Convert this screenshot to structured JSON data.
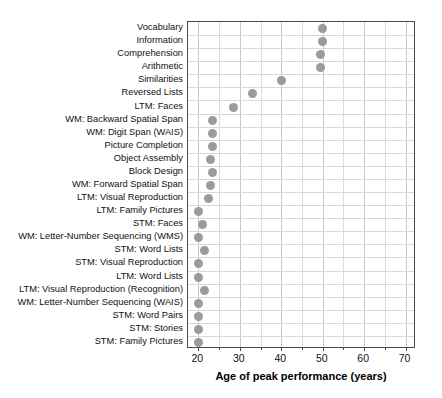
{
  "chart_data": {
    "type": "scatter",
    "title": "",
    "xlabel": "Age of peak performance (years)",
    "ylabel": "",
    "xlim": [
      17.5,
      72.5
    ],
    "xticks": [
      20,
      30,
      40,
      50,
      60,
      70
    ],
    "xtick_labels": [
      "20",
      "30",
      "40",
      "50",
      "60",
      "70"
    ],
    "grid": true,
    "legend": "none",
    "marker_color": "#9b9b9b",
    "axis_color": "#4a4a4a",
    "gridline_color": "#d0d0d0",
    "categories": [
      "Vocabulary",
      "Information",
      "Comprehension",
      "Arithmetic",
      "Similarities",
      "Reversed Lists",
      "LTM: Faces",
      "WM: Backward Spatial Span",
      "WM: Digit Span (WAIS)",
      "Picture Completion",
      "Object Assembly",
      "Block Design",
      "WM: Forward Spatial Span",
      "LTM: Visual Reproduction",
      "LTM: Family Pictures",
      "STM: Faces",
      "WM: Letter-Number Sequencing (WMS)",
      "STM: Word Lists",
      "STM: Visual Reproduction",
      "LTM: Word Lists",
      "LTM: Visual Reproduction (Recognition)",
      "WM: Letter-Number Sequencing (WAIS)",
      "STM: Word Pairs",
      "STM: Stories",
      "STM: Family Pictures"
    ],
    "values": [
      50.0,
      50.0,
      49.5,
      49.5,
      40.0,
      33.0,
      28.5,
      23.5,
      23.5,
      23.5,
      23.0,
      23.5,
      23.0,
      22.5,
      20.0,
      21.0,
      20.0,
      21.5,
      20.0,
      20.0,
      21.5,
      20.0,
      20.0,
      20.0,
      20.0
    ]
  }
}
